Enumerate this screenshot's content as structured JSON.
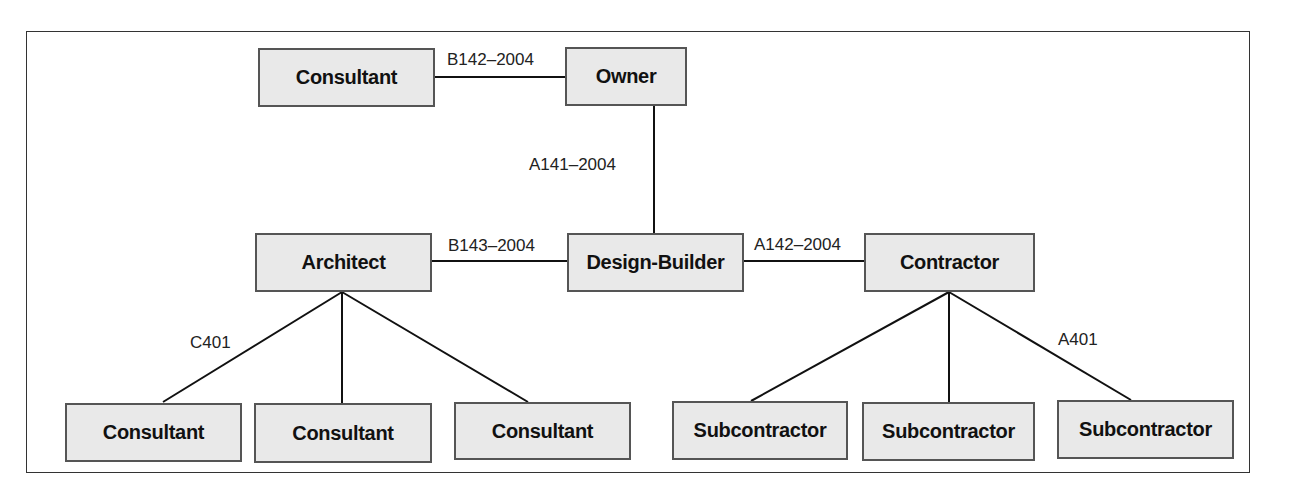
{
  "diagram": {
    "nodes": {
      "consultant_top": "Consultant",
      "owner": "Owner",
      "architect": "Architect",
      "design_builder": "Design-Builder",
      "contractor": "Contractor",
      "consultant_1": "Consultant",
      "consultant_2": "Consultant",
      "consultant_3": "Consultant",
      "subcontractor_1": "Subcontractor",
      "subcontractor_2": "Subcontractor",
      "subcontractor_3": "Subcontractor"
    },
    "edge_labels": {
      "owner_consultant": "B142–2004",
      "owner_design_builder": "A141–2004",
      "architect_design_builder": "B143–2004",
      "design_builder_contractor": "A142–2004",
      "architect_consultants": "C401",
      "contractor_subcontractors": "A401"
    },
    "colors": {
      "node_fill": "#e9e9e9",
      "node_border": "#555555",
      "line": "#111111"
    }
  }
}
